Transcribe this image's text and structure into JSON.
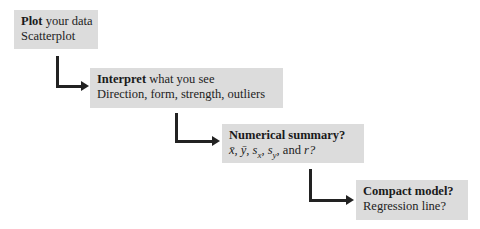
{
  "steps": [
    {
      "title": "Plot",
      "title_rest": " your data",
      "detail": "Scatterplot"
    },
    {
      "title": "Interpret",
      "title_rest": " what you see",
      "detail": "Direction, form, strength, outliers"
    },
    {
      "title": "Numerical summary?",
      "title_rest": "",
      "detail": "x̄, ȳ, sₓ, s_y, and r?"
    },
    {
      "title": "Compact model?",
      "title_rest": "",
      "detail": "Regression line?"
    }
  ],
  "colors": {
    "box_fill": "#dcdcdc",
    "arrow": "#222222"
  }
}
